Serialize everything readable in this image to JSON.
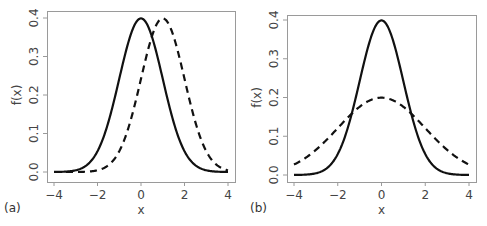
{
  "chart_data": [
    {
      "type": "line",
      "panel_label": "(a)",
      "title": "",
      "xlabel": "x",
      "ylabel": "f(x)",
      "xlim": [
        -4,
        4
      ],
      "ylim": [
        0,
        0.4
      ],
      "xticks": [
        "-4",
        "-2",
        "0",
        "2",
        "4"
      ],
      "yticks": [
        "0.0",
        "0.1",
        "0.2",
        "0.3",
        "0.4"
      ],
      "grid": false,
      "legend": "none",
      "series": [
        {
          "name": "N(0,1) solid",
          "style": "solid",
          "mean": 0,
          "sd": 1,
          "x": [
            -4,
            -3,
            -2,
            -1,
            0,
            1,
            2,
            3,
            4
          ],
          "values": [
            0.0001,
            0.004,
            0.054,
            0.242,
            0.399,
            0.242,
            0.054,
            0.004,
            0.0001
          ]
        },
        {
          "name": "N(1,1) dashed",
          "style": "dashed",
          "mean": 1,
          "sd": 1,
          "x": [
            -3,
            -2,
            -1,
            0,
            1,
            2,
            3,
            4
          ],
          "values": [
            0.0001,
            0.004,
            0.054,
            0.242,
            0.399,
            0.242,
            0.054,
            0.004
          ]
        }
      ]
    },
    {
      "type": "line",
      "panel_label": "(b)",
      "title": "",
      "xlabel": "x",
      "ylabel": "f(x)",
      "xlim": [
        -4,
        4
      ],
      "ylim": [
        0,
        0.4
      ],
      "xticks": [
        "-4",
        "-2",
        "0",
        "2",
        "4"
      ],
      "yticks": [
        "0.0",
        "0.1",
        "0.2",
        "0.3",
        "0.4"
      ],
      "grid": false,
      "legend": "none",
      "series": [
        {
          "name": "N(0,1) solid",
          "style": "solid",
          "mean": 0,
          "sd": 1,
          "x": [
            -4,
            -3,
            -2,
            -1,
            0,
            1,
            2,
            3,
            4
          ],
          "values": [
            0.0001,
            0.004,
            0.054,
            0.242,
            0.399,
            0.242,
            0.054,
            0.004,
            0.0001
          ]
        },
        {
          "name": "N(0,2) dashed",
          "style": "dashed",
          "mean": 0,
          "sd": 2,
          "x": [
            -4,
            -3,
            -2,
            -1,
            0,
            1,
            2,
            3,
            4
          ],
          "values": [
            0.027,
            0.065,
            0.121,
            0.176,
            0.199,
            0.176,
            0.121,
            0.065,
            0.027
          ]
        }
      ]
    }
  ],
  "panels": [
    {
      "label": "(a)",
      "xlabel": "x",
      "ylabel": "f(x)",
      "xticks": [
        "−4",
        "−2",
        "0",
        "2",
        "4"
      ],
      "yticks": [
        "0.0",
        "0.1",
        "0.2",
        "0.3",
        "0.4"
      ]
    },
    {
      "label": "(b)",
      "xlabel": "x",
      "ylabel": "f(x)",
      "xticks": [
        "−4",
        "−2",
        "0",
        "2",
        "4"
      ],
      "yticks": [
        "0.0",
        "0.1",
        "0.2",
        "0.3",
        "0.4"
      ]
    }
  ]
}
